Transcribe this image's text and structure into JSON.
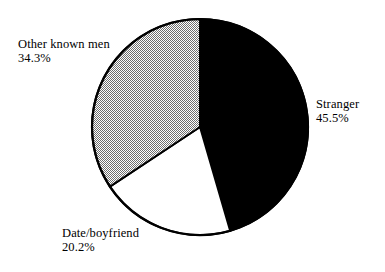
{
  "chart_data": {
    "type": "pie",
    "title": "",
    "subtitle": "",
    "xlabel": "",
    "ylabel": "",
    "legend_position": "none",
    "grid": false,
    "start_angle_deg": 0,
    "direction": "clockwise",
    "categories": [
      "Stranger",
      "Date/boyfriend",
      "Other known men"
    ],
    "values": [
      45.5,
      20.2,
      34.3
    ],
    "value_suffix": "%",
    "slices": [
      {
        "label": "Stranger",
        "value": 45.5,
        "value_text": "45.5%",
        "fill": "#000000",
        "fill_style": "solid-black",
        "stroke": "#000000",
        "label_position": "right"
      },
      {
        "label": "Date/boyfriend",
        "value": 20.2,
        "value_text": "20.2%",
        "fill": "#ffffff",
        "fill_style": "solid-white",
        "stroke": "#000000",
        "label_position": "bottom-left"
      },
      {
        "label": "Other known men",
        "value": 34.3,
        "value_text": "34.3%",
        "fill": "#a9a9a9",
        "fill_style": "dither-50-grey",
        "stroke": "#000000",
        "label_position": "top-left"
      }
    ],
    "geometry": {
      "center_x": 200,
      "center_y": 127,
      "radius": 108,
      "outline_color": "#000000",
      "outline_width": 2.2,
      "background": "#ffffff"
    }
  }
}
